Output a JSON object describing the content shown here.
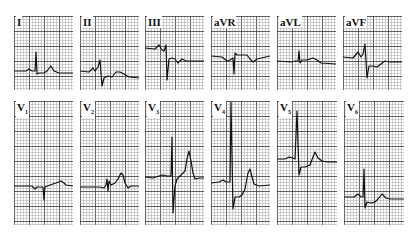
{
  "figure": {
    "colors": {
      "grid_minor": "#9a9a9a",
      "grid_major": "#3a3a3a",
      "trace": "#111111",
      "background": "#ffffff"
    },
    "rows": [
      {
        "name": "limb-leads",
        "y": 16,
        "height": 74,
        "leads": [
          {
            "id": "I",
            "label": "I",
            "x": 14,
            "w": 59,
            "points": "0,55 12,55 15,53 18,55 21,55 22,36 23,58 25,57 30,57 33,55 37,50 40,55 45,57 59,57"
          },
          {
            "id": "II",
            "label": "II",
            "x": 80,
            "w": 59,
            "points": "0,55 9,56 13,52 15,55 18,51 20,44 22,70 24,62 28,60 32,61 36,56 40,56 44,58 49,61 59,62"
          },
          {
            "id": "III",
            "label": "III",
            "x": 145,
            "w": 59,
            "points": "0,32 10,33 14,29 17,34 19,35 21,29 22,64 24,43 27,42 30,43 33,47 37,43 41,45 45,45 59,45"
          },
          {
            "id": "aVR",
            "label": "aVR",
            "x": 211,
            "w": 59,
            "points": "0,40 11,41 16,45 19,44 22,42 23,58 24,37 26,39 31,39 36,39 39,43 42,46 46,43 59,40"
          },
          {
            "id": "aVL",
            "label": "aVL",
            "x": 277,
            "w": 59,
            "points": "0,45 14,46 18,45 21,45 22,35 23,47 25,44 30,44 36,42 40,44 44,47 59,48"
          },
          {
            "id": "aVF",
            "label": "aVF",
            "x": 343,
            "w": 59,
            "points": "0,41 10,42 15,36 18,41 20,38 22,28 24,62 26,50 30,50 34,51 38,48 42,45 46,46 59,46"
          }
        ]
      },
      {
        "name": "precordial-leads",
        "y": 101,
        "height": 124,
        "leads": [
          {
            "id": "V1",
            "label": "V",
            "sub": "1",
            "x": 14,
            "w": 59,
            "points": "0,85 18,85 21,88 23,86 27,86 29,86 30,99 31,86 36,84 42,82 47,80 50,82 52,84 59,85"
          },
          {
            "id": "V2",
            "label": "V",
            "sub": "2",
            "x": 80,
            "w": 59,
            "points": "0,86 20,86 24,87 26,84 27,78 28,90 29,80 31,84 35,82 38,78 41,72 43,74 45,82 48,87 51,85 59,85"
          },
          {
            "id": "V3",
            "label": "V",
            "sub": "3",
            "x": 145,
            "w": 59,
            "points": "0,76 8,77 14,75 18,74 22,75 26,75 27,36 28,112 30,85 32,78 36,74 40,70 42,58 44,50 46,60 48,72 50,78 54,77 59,77"
          },
          {
            "id": "V4",
            "label": "V",
            "sub": "4",
            "x": 211,
            "w": 59,
            "points": "0,82 8,81 12,79 15,81 19,81 20,1 22,108 24,96 28,96 31,94 34,88 37,72 39,68 41,76 43,83 48,85 59,84"
          },
          {
            "id": "V5",
            "label": "V",
            "sub": "5",
            "x": 277,
            "w": 60,
            "points": "0,58 8,58 12,56 16,57 18,58 20,10 22,74 24,66 28,66 33,64 36,56 38,51 41,57 45,60 50,61 60,61"
          },
          {
            "id": "V6",
            "label": "V",
            "sub": "6",
            "x": 344,
            "w": 60,
            "points": "0,96 10,96 14,93 17,96 19,96 20,68 21,107 23,101 27,102 31,101 34,98 38,93 42,97 46,98 52,98 60,98"
          }
        ]
      }
    ]
  }
}
